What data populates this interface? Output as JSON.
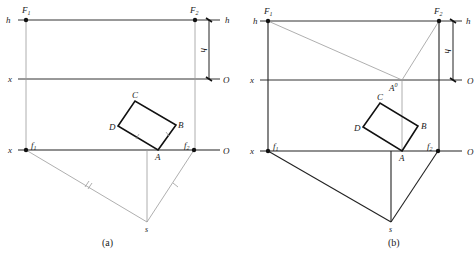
{
  "figure": {
    "panels": [
      {
        "caption": "(a)",
        "labels": {
          "h_left": "h",
          "h_right": "h",
          "h_dim": "h",
          "x_upper": "x",
          "o_upper": "O",
          "x_lower": "x",
          "o_lower": "O",
          "F1": "F",
          "F1_sub": "1",
          "F2": "F",
          "F2_sub": "2",
          "f1": "f",
          "f1_sub": "1",
          "f2": "f",
          "f2_sub": "2",
          "A": "A",
          "B": "B",
          "C": "C",
          "D": "D",
          "s": "s"
        }
      },
      {
        "caption": "(b)",
        "labels": {
          "h_left": "h",
          "h_right": "h",
          "h_dim": "h",
          "x_upper": "x",
          "o_upper": "O",
          "x_lower": "x",
          "o_lower": "O",
          "F1": "F",
          "F1_sub": "1",
          "F2": "F",
          "F2_sub": "2",
          "f1": "f",
          "f1_sub": "1",
          "f2": "f",
          "f2_sub": "2",
          "A0": "A",
          "A0_sup": "0",
          "A": "A",
          "B": "B",
          "C": "C",
          "D": "D",
          "s": "s"
        }
      }
    ],
    "colors": {
      "thick": "#111111",
      "thin": "#9a9a9a",
      "ink": "#222222"
    }
  }
}
